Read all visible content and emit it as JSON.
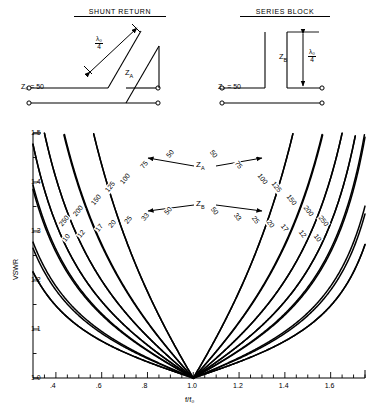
{
  "figure": {
    "schematics": [
      {
        "title": "SHUNT RETURN",
        "z0_label": "Z₀ = 50",
        "stub_label": "Zᴀ",
        "stub_label_main": "Z",
        "stub_label_sub": "A",
        "dimension_num": "λ₀",
        "dimension_den": "4"
      },
      {
        "title": "SERIES BLOCK",
        "z0_label": "Z₀ = 50",
        "stub_label": "Zʙ",
        "stub_label_main": "Z",
        "stub_label_sub": "B",
        "dimension_num": "λ₀",
        "dimension_den": "4"
      }
    ],
    "annotations": [
      {
        "name": "za-callout",
        "main": "Z",
        "sub": "A"
      },
      {
        "name": "zb-callout",
        "main": "Z",
        "sub": "B"
      }
    ]
  },
  "chart_data": {
    "type": "line",
    "title": "",
    "xlabel": "f/f₀",
    "ylabel": "VSWR",
    "xlim": [
      0.3,
      1.75
    ],
    "ylim": [
      1.0,
      1.5
    ],
    "xticks": [
      0.4,
      0.6,
      0.8,
      1.0,
      1.2,
      1.4,
      1.6
    ],
    "xticklabels": [
      ".4",
      ".6",
      ".8",
      "1.0",
      "1.2",
      "1.4",
      "1.6"
    ],
    "xminor_step": 0.05,
    "yticks": [
      1.0,
      1.1,
      1.2,
      1.3,
      1.4,
      1.5
    ],
    "yticklabels": [
      "1.0",
      "1.1",
      "1.2",
      "1.3",
      "1.4",
      "1.5"
    ],
    "yminor_step": 0.05,
    "grid": false,
    "legend": "none",
    "convergence_point": {
      "x": 1.0,
      "y": 1.0
    },
    "series": [
      {
        "name": "Z_A = 250",
        "group": "ZA",
        "impedance": 250,
        "label": "250",
        "label_left_xy": [
          0.435,
          1.318
        ],
        "label_right_xy": [
          1.565,
          1.318
        ]
      },
      {
        "name": "Z_A = 200",
        "group": "ZA",
        "impedance": 200,
        "label": "200",
        "label_left_xy": [
          0.497,
          1.338
        ],
        "label_right_xy": [
          1.503,
          1.338
        ]
      },
      {
        "name": "Z_A = 150",
        "group": "ZA",
        "impedance": 150,
        "label": "150",
        "label_left_xy": [
          0.575,
          1.362
        ],
        "label_right_xy": [
          1.425,
          1.362
        ]
      },
      {
        "name": "Z_A = 125",
        "group": "ZA",
        "impedance": 125,
        "label": "125",
        "label_left_xy": [
          0.637,
          1.387
        ],
        "label_right_xy": [
          1.363,
          1.387
        ]
      },
      {
        "name": "Z_A = 100",
        "group": "ZA",
        "impedance": 100,
        "label": "100",
        "label_left_xy": [
          0.7,
          1.405
        ],
        "label_right_xy": [
          1.3,
          1.405
        ]
      },
      {
        "name": "Z_A = 75",
        "group": "ZA",
        "impedance": 75,
        "label": "75",
        "label_left_xy": [
          0.795,
          1.432
        ],
        "label_right_xy": [
          1.205,
          1.432
        ]
      },
      {
        "name": "Z_A = 50",
        "group": "ZA",
        "impedance": 50,
        "label": "50",
        "label_left_xy": [
          0.905,
          1.455
        ],
        "label_right_xy": [
          1.095,
          1.455
        ]
      },
      {
        "name": "Z_B = 10",
        "group": "ZB",
        "impedance": 10,
        "label": "10",
        "label_left_xy": [
          0.452,
          1.283
        ],
        "label_right_xy": [
          1.548,
          1.283
        ]
      },
      {
        "name": "Z_B = 12",
        "group": "ZB",
        "impedance": 12,
        "label": "12",
        "label_left_xy": [
          0.518,
          1.292
        ],
        "label_right_xy": [
          1.482,
          1.292
        ]
      },
      {
        "name": "Z_B = 17",
        "group": "ZB",
        "impedance": 17,
        "label": "17",
        "label_left_xy": [
          0.597,
          1.305
        ],
        "label_right_xy": [
          1.403,
          1.305
        ]
      },
      {
        "name": "Z_B = 20",
        "group": "ZB",
        "impedance": 20,
        "label": "20",
        "label_left_xy": [
          0.655,
          1.312
        ],
        "label_right_xy": [
          1.345,
          1.312
        ]
      },
      {
        "name": "Z_B = 25",
        "group": "ZB",
        "impedance": 25,
        "label": "25",
        "label_left_xy": [
          0.722,
          1.32
        ],
        "label_right_xy": [
          1.278,
          1.32
        ]
      },
      {
        "name": "Z_B = 33",
        "group": "ZB",
        "impedance": 33,
        "label": "33",
        "label_left_xy": [
          0.8,
          1.327
        ],
        "label_right_xy": [
          1.2,
          1.327
        ]
      },
      {
        "name": "Z_B = 50",
        "group": "ZB",
        "impedance": 50,
        "label": "50",
        "label_left_xy": [
          0.9,
          1.338
        ],
        "label_right_xy": [
          1.1,
          1.338
        ]
      }
    ]
  }
}
